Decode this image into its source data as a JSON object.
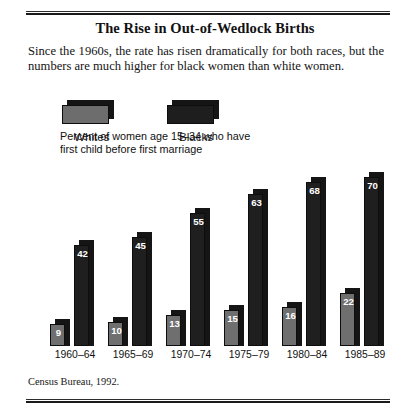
{
  "figure": {
    "title": "The Rise in Out-of-Wedlock Births",
    "subtitle": "Since the 1960s, the rate has risen dramatically for both races, but the numbers are much higher for black women than white women.",
    "caption": "Percent of women age 15–34 who have\nfirst child before first marriage",
    "source": "Census Bureau, 1992."
  },
  "legend": {
    "items": [
      {
        "label": "Whites",
        "color": "#6f6f6f"
      },
      {
        "label": "Blacks",
        "color": "#1f1f1f"
      }
    ]
  },
  "colors": {
    "whites": "#6f6f6f",
    "blacks": "#1f1f1f",
    "shadow": "#151515",
    "rule": "#1a1a1a",
    "value_label": "#ffffff"
  },
  "chart_data": {
    "type": "bar",
    "title": "The Rise in Out-of-Wedlock Births",
    "subtitle": "Percent of women age 15–34 who have first child before first marriage",
    "xlabel": "",
    "ylabel": "Percent",
    "ylim": [
      0,
      75
    ],
    "grid": false,
    "legend_position": "top-left",
    "categories": [
      "1960–64",
      "1965–69",
      "1970–74",
      "1975–79",
      "1980–84",
      "1985–89"
    ],
    "series": [
      {
        "name": "Whites",
        "color": "#6f6f6f",
        "values": [
          9,
          10,
          13,
          15,
          16,
          22
        ]
      },
      {
        "name": "Blacks",
        "color": "#1f1f1f",
        "values": [
          42,
          45,
          55,
          63,
          68,
          70
        ]
      }
    ],
    "source": "Census Bureau, 1992."
  }
}
